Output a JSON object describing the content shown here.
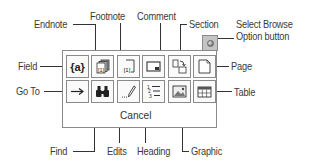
{
  "diagram": {
    "palette": {
      "row1": [
        {
          "id": "field",
          "label": "Field",
          "icon": "field-code-icon"
        },
        {
          "id": "endnote",
          "label": "Endnote",
          "icon": "endnote-icon"
        },
        {
          "id": "footnote",
          "label": "Footnote",
          "icon": "footnote-icon"
        },
        {
          "id": "comment",
          "label": "Comment",
          "icon": "comment-icon"
        },
        {
          "id": "section",
          "label": "Section",
          "icon": "section-icon"
        },
        {
          "id": "page",
          "label": "Page",
          "icon": "page-icon"
        }
      ],
      "row2": [
        {
          "id": "goto",
          "label": "Go To",
          "icon": "arrow-right-icon"
        },
        {
          "id": "find",
          "label": "Find",
          "icon": "binoculars-icon"
        },
        {
          "id": "edits",
          "label": "Edits",
          "icon": "pencil-icon"
        },
        {
          "id": "heading",
          "label": "Heading",
          "icon": "numbered-list-icon"
        },
        {
          "id": "graphic",
          "label": "Graphic",
          "icon": "picture-icon"
        },
        {
          "id": "table",
          "label": "Table",
          "icon": "table-icon"
        }
      ],
      "cancel_label": "Cancel",
      "field_glyph": "{a}",
      "footnote_glyph": "[1]"
    },
    "callouts": {
      "endnote": "Endnote",
      "footnote": "Footnote",
      "comment": "Comment",
      "section": "Section",
      "select_browse_line1": "Select Browse",
      "select_browse_line2": "Option button",
      "field": "Field",
      "page": "Page",
      "goto": "Go To",
      "table": "Table",
      "find": "Find",
      "edits": "Edits",
      "heading": "Heading",
      "graphic": "Graphic"
    }
  }
}
